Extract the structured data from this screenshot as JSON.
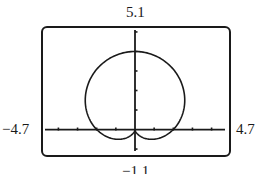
{
  "window": {
    "ymax_label": "5.1",
    "ymin_label": "−1.1",
    "xmin_label": "−4.7",
    "xmax_label": "4.7"
  },
  "chart_data": {
    "type": "line",
    "title": "",
    "subtitle": "",
    "xlabel": "",
    "ylabel": "",
    "equation": "r = 2 + 2 sin θ",
    "xlim": [
      -4.7,
      4.7
    ],
    "ylim": [
      -1.1,
      5.1
    ],
    "xtick_step": 1,
    "ytick_step": 1,
    "grid": false,
    "legend": null,
    "series": [
      {
        "name": "r = 2 + 2 sin θ",
        "polar": true,
        "theta_range": [
          0,
          6.2832
        ],
        "key_points": [
          {
            "x": 2,
            "y": 0
          },
          {
            "x": 2.6,
            "y": 1.5
          },
          {
            "x": 0,
            "y": 4
          },
          {
            "x": -2.6,
            "y": 1.5
          },
          {
            "x": -2,
            "y": 0
          },
          {
            "x": -0.87,
            "y": -0.5
          },
          {
            "x": 0,
            "y": 0
          },
          {
            "x": 0.87,
            "y": -0.5
          }
        ]
      }
    ],
    "colors": {
      "curve": "#1a1a1a",
      "axes": "#1a1a1a",
      "frame": "#1a1a1a"
    }
  }
}
